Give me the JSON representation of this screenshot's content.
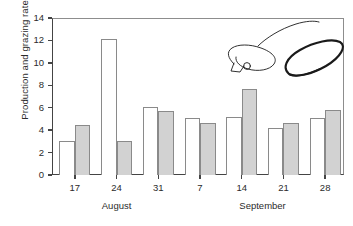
{
  "chart_data": {
    "type": "bar",
    "title": "",
    "xlabel": "",
    "ylabel": "Production and grazing rates",
    "ylim": [
      0,
      14
    ],
    "yticks": [
      0,
      2,
      4,
      6,
      8,
      10,
      12,
      14
    ],
    "grid": false,
    "legend": "none",
    "categories": [
      "17",
      "24",
      "31",
      "7",
      "14",
      "21",
      "28"
    ],
    "group_labels": [
      {
        "label": "August",
        "categories": [
          "17",
          "24",
          "31"
        ]
      },
      {
        "label": "September",
        "categories": [
          "7",
          "14",
          "21",
          "28"
        ]
      }
    ],
    "series": [
      {
        "name": "Production",
        "style": "open",
        "color": "#ffffff",
        "edge_color": "#8a8a8a",
        "values": [
          3.0,
          12.1,
          6.1,
          5.1,
          5.15,
          4.15,
          5.1
        ]
      },
      {
        "name": "Grazing",
        "style": "filled",
        "color": "#d2d2d2",
        "edge_color": "#8a8a8a",
        "values": [
          4.5,
          3.0,
          5.7,
          4.6,
          7.65,
          4.65,
          5.8
        ]
      }
    ],
    "annotations": [
      {
        "name": "hand-drawn-doodle",
        "description": "hand-drawn ink scribble: thin looping curve at left and bold dark ellipse at right",
        "color": "#1a1a1a"
      }
    ]
  },
  "axes": {
    "ytick_labels": [
      "0",
      "2",
      "4",
      "6",
      "8",
      "10",
      "12",
      "14"
    ],
    "xtick_labels": [
      "17",
      "24",
      "31",
      "7",
      "14",
      "21",
      "28"
    ],
    "month_august": "August",
    "month_september": "September",
    "y_axis_title": "Production and grazing rates"
  }
}
